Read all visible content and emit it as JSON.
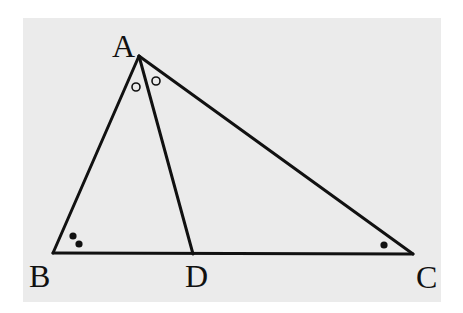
{
  "diagram": {
    "type": "triangle-with-angle-bisector",
    "background_color": "#ebebeb",
    "stroke_color": "#111111",
    "vertices": {
      "A": {
        "label": "A",
        "x": 139,
        "y": 56
      },
      "B": {
        "label": "B",
        "x": 53,
        "y": 253
      },
      "C": {
        "label": "C",
        "x": 413,
        "y": 254
      },
      "D": {
        "label": "D",
        "x": 193,
        "y": 254
      }
    },
    "segments": [
      "AB",
      "AC",
      "BC",
      "AD"
    ],
    "angle_marks": {
      "A_left": {
        "symbol": "open-circle",
        "angle": "BAD",
        "x": 136,
        "y": 87
      },
      "A_right": {
        "symbol": "open-circle",
        "angle": "DAC",
        "x": 156,
        "y": 81
      },
      "B_dot1": {
        "symbol": "filled-dot",
        "angle": "ABC",
        "x": 73,
        "y": 236
      },
      "B_dot2": {
        "symbol": "filled-dot",
        "angle": "ABC",
        "x": 79,
        "y": 244
      },
      "C_dot": {
        "symbol": "filled-dot",
        "angle": "ACB",
        "x": 384,
        "y": 245
      }
    },
    "labels": {
      "A": "A",
      "B": "B",
      "C": "C",
      "D": "D"
    }
  }
}
